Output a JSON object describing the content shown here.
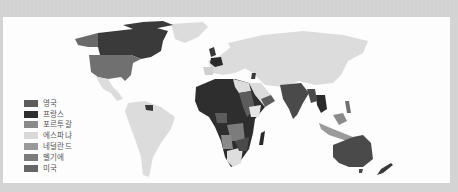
{
  "map": {
    "title": "",
    "legend": [
      {
        "label": "영국",
        "color": "#5c5c5c",
        "meaning": "United Kingdom"
      },
      {
        "label": "프랑스",
        "color": "#2e2e2e",
        "meaning": "France"
      },
      {
        "label": "포르투갈",
        "color": "#8a8a8a",
        "meaning": "Portugal"
      },
      {
        "label": "에스파냐",
        "color": "#d9d9d9",
        "meaning": "Spain"
      },
      {
        "label": "네덜란드",
        "color": "#9a9a9a",
        "meaning": "Netherlands"
      },
      {
        "label": "벨기에",
        "color": "#7c7c7c",
        "meaning": "Belgium"
      },
      {
        "label": "미국",
        "color": "#666666",
        "meaning": "United States"
      }
    ],
    "colors": {
      "background_land": "#dedede",
      "frame": "#d2d2d2",
      "panel": "#fdfdfd"
    }
  }
}
